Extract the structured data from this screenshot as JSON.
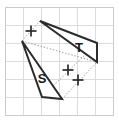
{
  "figure": {
    "background_color": "#ffffff",
    "width": 119,
    "height": 122,
    "grid": {
      "color": "#d9dde2",
      "border_color": "#c8ccd2",
      "cell_size": 18,
      "x_lines": [
        5,
        23,
        41,
        59,
        77,
        95,
        113
      ],
      "y_lines": [
        7,
        25,
        43,
        61,
        79,
        97,
        115
      ]
    },
    "shapes": [
      {
        "id": "shape-s",
        "label": "S",
        "label_x": 42,
        "label_y": 83,
        "stroke": "#2b2b2b",
        "fill": "#ffffff",
        "points": "22,41 42,97 62,99"
      },
      {
        "id": "shape-t",
        "label": "T",
        "label_x": 79,
        "label_y": 52,
        "stroke": "#2b2b2b",
        "fill": "#ffffff",
        "points": "40,21 97,43 97,62"
      }
    ],
    "rays": [
      {
        "id": "ray-1",
        "x1": 22,
        "y1": 41,
        "x2": 40,
        "y2": 21
      },
      {
        "id": "ray-2",
        "x1": 62,
        "y1": 99,
        "x2": 97,
        "y2": 62
      },
      {
        "id": "ray-3",
        "x1": 42,
        "y1": 97,
        "x2": 97,
        "y2": 43
      },
      {
        "id": "ray-4",
        "x1": 22,
        "y1": 41,
        "x2": 97,
        "y2": 62
      }
    ],
    "crosses": [
      {
        "id": "cross-1",
        "cx": 31,
        "cy": 31,
        "size": 11
      },
      {
        "id": "cross-2",
        "cx": 68,
        "cy": 70,
        "size": 11
      },
      {
        "id": "cross-3",
        "cx": 78,
        "cy": 80,
        "size": 11
      }
    ]
  }
}
